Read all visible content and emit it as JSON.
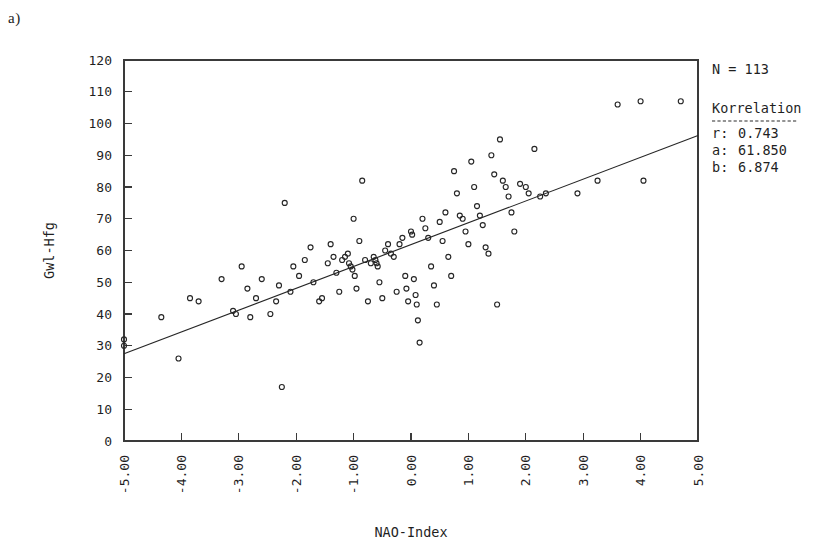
{
  "panel": {
    "label": "a)"
  },
  "chart_data": {
    "type": "scatter",
    "title": "",
    "xlabel": "NAO-Index",
    "ylabel": "Gwl-Hfg",
    "xlim": [
      -5,
      5
    ],
    "ylim": [
      0,
      120
    ],
    "xticks": [
      -5,
      -4,
      -3,
      -2,
      -1,
      0,
      1,
      2,
      3,
      4,
      5
    ],
    "xticklabels": [
      "-5.00",
      "-4.00",
      "-3.00",
      "-2.00",
      "-1.00",
      "0.00",
      "1.00",
      "2.00",
      "3.00",
      "4.00",
      "5.00"
    ],
    "yticks": [
      0,
      10,
      20,
      30,
      40,
      50,
      60,
      70,
      80,
      90,
      100,
      110,
      120
    ],
    "yticklabels": [
      "0",
      "10",
      "20",
      "30",
      "40",
      "50",
      "60",
      "70",
      "80",
      "90",
      "100",
      "110",
      "120"
    ],
    "grid": false,
    "tick_direction": "in",
    "xtick_label_rotation": -90,
    "marker": "open-circle",
    "marker_size": 5,
    "n_points": 113,
    "fit": {
      "type": "linear",
      "intercept": 61.85,
      "slope": 6.874,
      "r": 0.743,
      "x_start": -5,
      "x_end": 5,
      "y_start": 27.48,
      "y_end": 96.22
    },
    "points": [
      [
        -5.0,
        32
      ],
      [
        -5.0,
        30
      ],
      [
        -4.35,
        39
      ],
      [
        -4.05,
        26
      ],
      [
        -3.85,
        45
      ],
      [
        -3.7,
        44
      ],
      [
        -3.3,
        51
      ],
      [
        -3.1,
        41
      ],
      [
        -3.05,
        40
      ],
      [
        -2.95,
        55
      ],
      [
        -2.85,
        48
      ],
      [
        -2.8,
        39
      ],
      [
        -2.7,
        45
      ],
      [
        -2.6,
        51
      ],
      [
        -2.45,
        40
      ],
      [
        -2.35,
        44
      ],
      [
        -2.3,
        49
      ],
      [
        -2.25,
        17
      ],
      [
        -2.2,
        75
      ],
      [
        -2.1,
        47
      ],
      [
        -2.05,
        55
      ],
      [
        -1.95,
        52
      ],
      [
        -1.85,
        57
      ],
      [
        -1.75,
        61
      ],
      [
        -1.7,
        50
      ],
      [
        -1.6,
        44
      ],
      [
        -1.55,
        45
      ],
      [
        -1.45,
        56
      ],
      [
        -1.4,
        62
      ],
      [
        -1.35,
        58
      ],
      [
        -1.3,
        53
      ],
      [
        -1.25,
        47
      ],
      [
        -1.2,
        57
      ],
      [
        -1.15,
        58
      ],
      [
        -1.1,
        59
      ],
      [
        -1.08,
        56
      ],
      [
        -1.05,
        55
      ],
      [
        -1.02,
        54
      ],
      [
        -1.0,
        70
      ],
      [
        -0.98,
        52
      ],
      [
        -0.95,
        48
      ],
      [
        -0.9,
        63
      ],
      [
        -0.85,
        82
      ],
      [
        -0.8,
        57
      ],
      [
        -0.75,
        44
      ],
      [
        -0.7,
        56
      ],
      [
        -0.65,
        58
      ],
      [
        -0.62,
        57
      ],
      [
        -0.6,
        56
      ],
      [
        -0.58,
        55
      ],
      [
        -0.55,
        50
      ],
      [
        -0.5,
        45
      ],
      [
        -0.45,
        60
      ],
      [
        -0.4,
        62
      ],
      [
        -0.35,
        59
      ],
      [
        -0.3,
        58
      ],
      [
        -0.25,
        47
      ],
      [
        -0.2,
        62
      ],
      [
        -0.15,
        64
      ],
      [
        -0.1,
        52
      ],
      [
        -0.08,
        48
      ],
      [
        -0.05,
        44
      ],
      [
        0.0,
        66
      ],
      [
        0.02,
        65
      ],
      [
        0.05,
        51
      ],
      [
        0.08,
        46
      ],
      [
        0.1,
        43
      ],
      [
        0.12,
        38
      ],
      [
        0.15,
        31
      ],
      [
        0.2,
        70
      ],
      [
        0.25,
        67
      ],
      [
        0.3,
        64
      ],
      [
        0.35,
        55
      ],
      [
        0.4,
        49
      ],
      [
        0.45,
        43
      ],
      [
        0.5,
        69
      ],
      [
        0.55,
        63
      ],
      [
        0.6,
        72
      ],
      [
        0.65,
        58
      ],
      [
        0.7,
        52
      ],
      [
        0.75,
        85
      ],
      [
        0.8,
        78
      ],
      [
        0.85,
        71
      ],
      [
        0.9,
        70
      ],
      [
        0.95,
        66
      ],
      [
        1.0,
        62
      ],
      [
        1.05,
        88
      ],
      [
        1.1,
        80
      ],
      [
        1.15,
        74
      ],
      [
        1.2,
        71
      ],
      [
        1.25,
        68
      ],
      [
        1.3,
        61
      ],
      [
        1.35,
        59
      ],
      [
        1.4,
        90
      ],
      [
        1.45,
        84
      ],
      [
        1.5,
        43
      ],
      [
        1.55,
        95
      ],
      [
        1.6,
        82
      ],
      [
        1.65,
        80
      ],
      [
        1.7,
        77
      ],
      [
        1.75,
        72
      ],
      [
        1.8,
        66
      ],
      [
        1.9,
        81
      ],
      [
        2.0,
        80
      ],
      [
        2.05,
        78
      ],
      [
        2.15,
        92
      ],
      [
        2.25,
        77
      ],
      [
        2.35,
        78
      ],
      [
        2.9,
        78
      ],
      [
        3.25,
        82
      ],
      [
        3.6,
        106
      ],
      [
        4.0,
        107
      ],
      [
        4.05,
        82
      ],
      [
        4.7,
        107
      ]
    ]
  },
  "legend": {
    "n_label": "N = 113",
    "title": "Korrelation",
    "rows": [
      {
        "key": "r:",
        "value": "0.743"
      },
      {
        "key": "a:",
        "value": "61.850"
      },
      {
        "key": "b:",
        "value": "6.874"
      }
    ]
  }
}
